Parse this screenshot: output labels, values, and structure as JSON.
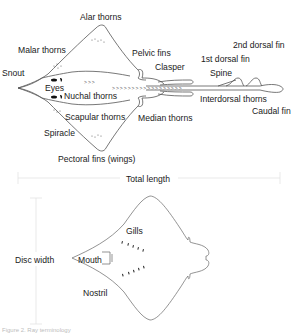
{
  "dorsal_view": {
    "labels": {
      "alar_thorns": "Alar thorns",
      "malar_thorns": "Malar thorns",
      "pelvic_fins": "Pelvic fins",
      "second_dorsal_fin": "2nd dorsal fin",
      "first_dorsal_fin": "1st dorsal fin",
      "clasper": "Clasper",
      "spine": "Spine",
      "snout": "Snout",
      "eyes": "Eyes",
      "nuchal_thorns": "Nuchal thorns",
      "interdorsal_thorns": "Interdorsal thorns",
      "caudal_fin": "Caudal fin",
      "scapular_thorns": "Scapular thorns",
      "median_thorns": "Median thorns",
      "spiracle": "Spiracle",
      "pectoral_fins": "Pectoral fins (wings)"
    }
  },
  "measurements": {
    "total_length": "Total length",
    "disc_width": "Disc width"
  },
  "ventral_view": {
    "labels": {
      "gills": "Gills",
      "mouth": "Mouth",
      "nostril": "Nostril"
    }
  },
  "caption": "Figure 2. Ray terminology",
  "colors": {
    "outline": "#555555",
    "text": "#1a1a1a",
    "measure_line": "#e0e0e0"
  }
}
